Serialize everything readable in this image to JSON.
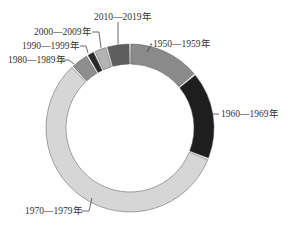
{
  "chart_data": {
    "type": "pie",
    "subtype": "donut",
    "title": "",
    "categories": [
      "1950—1959年",
      "1960—1969年",
      "1970—1979年",
      "1980—1989年",
      "1990—1999年",
      "2000—2009年",
      "2010—2019年"
    ],
    "values": [
      14,
      17,
      57,
      3.5,
      1.5,
      2.5,
      4.5
    ],
    "unit": "percent (estimated from slice angles)",
    "colors": [
      "#8a8a8a",
      "#1e1e1e",
      "#d6d6d6",
      "#8e8e8e",
      "#2a2a2a",
      "#b4b4b4",
      "#5e5e5e"
    ],
    "start_angle_deg": 0,
    "direction": "clockwise",
    "legend": "none (direct labels with leader lines)",
    "labels": [
      {
        "text": "1950—1959年",
        "x": 153,
        "y": 47,
        "anchor": "start",
        "line": [
          [
            150,
            44
          ],
          [
            152,
            44
          ],
          [
            147,
            52
          ]
        ]
      },
      {
        "text": "1960—1969年",
        "x": 221,
        "y": 117,
        "anchor": "start",
        "line": [
          [
            212,
            114
          ],
          [
            219,
            114
          ]
        ]
      },
      {
        "text": "1970—1979年",
        "x": 25,
        "y": 214,
        "anchor": "start",
        "line": [
          [
            81,
            211
          ],
          [
            89,
            211
          ],
          [
            92,
            198
          ]
        ]
      },
      {
        "text": "1980—1989年",
        "x": 8,
        "y": 63,
        "anchor": "start",
        "line": [
          [
            62,
            60
          ],
          [
            69,
            60
          ],
          [
            74,
            64
          ]
        ]
      },
      {
        "text": "1990—1999年",
        "x": 22,
        "y": 49,
        "anchor": "start",
        "line": [
          [
            80,
            46
          ],
          [
            86,
            46
          ],
          [
            88,
            53
          ]
        ]
      },
      {
        "text": "2000—2009年",
        "x": 34,
        "y": 35,
        "anchor": "start",
        "line": [
          [
            92,
            32
          ],
          [
            99,
            32
          ],
          [
            101,
            48
          ]
        ]
      },
      {
        "text": "2010—2019年",
        "x": 94,
        "y": 20,
        "anchor": "start",
        "line": [
          [
            118,
            22
          ],
          [
            118,
            44
          ]
        ]
      }
    ]
  },
  "geometry": {
    "cx": 130,
    "cy": 128,
    "outer_r": 84,
    "inner_r": 64,
    "gap_deg": 1.2
  }
}
